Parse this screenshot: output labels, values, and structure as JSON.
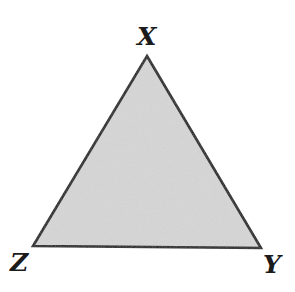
{
  "figure": {
    "kind": "geometry-diagram",
    "shape_name": "triangle",
    "background_color": "#ffffff",
    "width": 295,
    "height": 292
  },
  "triangle": {
    "fill_color": "#d6d6d6",
    "stroke_color": "#1b1b1b",
    "stroke_width": 2.6,
    "vertices": [
      {
        "name": "X",
        "x": 147,
        "y": 56
      },
      {
        "name": "Y",
        "x": 261,
        "y": 248
      },
      {
        "name": "Z",
        "x": 33,
        "y": 246
      }
    ],
    "points_attr": "147,56 261,248 33,246"
  },
  "labels": {
    "apex": "X",
    "bottom_right": "Y",
    "bottom_left": "Z"
  }
}
